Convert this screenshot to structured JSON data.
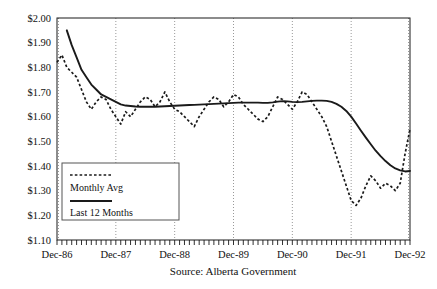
{
  "chart_data": {
    "type": "line",
    "title": "",
    "subtitle": "",
    "xlabel": "",
    "ylabel": "",
    "source": "Source: Alberta Government",
    "grid": true,
    "grid_style": "dotted-vertical-yearly",
    "legend_position": "inside-lower-left",
    "ylim": [
      1.1,
      2.0
    ],
    "ytick_labels": [
      "$2.00",
      "$1.90",
      "$1.80",
      "$1.70",
      "$1.60",
      "$1.50",
      "$1.40",
      "$1.30",
      "$1.20",
      "$1.10"
    ],
    "ytick_values": [
      2.0,
      1.9,
      1.8,
      1.7,
      1.6,
      1.5,
      1.4,
      1.3,
      1.2,
      1.1
    ],
    "xtick_labels": [
      "Dec-86",
      "Dec-87",
      "Dec-88",
      "Dec-89",
      "Dec-90",
      "Dec-91",
      "Dec-92"
    ],
    "xtick_values": [
      0,
      12,
      24,
      36,
      48,
      60,
      72
    ],
    "xlim": [
      0,
      72
    ],
    "x_minor_tick_interval_months": 1,
    "series": [
      {
        "name": "Monthly Avg",
        "style": "dotted",
        "color": "#1a1a1a",
        "values": [
          1.82,
          1.85,
          1.8,
          1.78,
          1.76,
          1.71,
          1.66,
          1.63,
          1.66,
          1.68,
          1.67,
          1.63,
          1.6,
          1.57,
          1.62,
          1.6,
          1.63,
          1.66,
          1.68,
          1.67,
          1.64,
          1.66,
          1.7,
          1.66,
          1.63,
          1.62,
          1.6,
          1.58,
          1.56,
          1.6,
          1.63,
          1.66,
          1.68,
          1.67,
          1.64,
          1.66,
          1.69,
          1.68,
          1.65,
          1.63,
          1.61,
          1.59,
          1.58,
          1.6,
          1.64,
          1.68,
          1.67,
          1.65,
          1.63,
          1.66,
          1.7,
          1.69,
          1.66,
          1.63,
          1.6,
          1.56,
          1.5,
          1.44,
          1.38,
          1.32,
          1.26,
          1.24,
          1.27,
          1.32,
          1.36,
          1.34,
          1.31,
          1.33,
          1.32,
          1.3,
          1.33,
          1.45,
          1.55
        ]
      },
      {
        "name": "Last 12 Months",
        "style": "solid",
        "color": "#1a1a1a",
        "values": [
          2.1,
          2.02,
          1.95,
          1.89,
          1.84,
          1.79,
          1.76,
          1.73,
          1.71,
          1.69,
          1.68,
          1.67,
          1.66,
          1.65,
          1.645,
          1.643,
          1.641,
          1.64,
          1.64,
          1.64,
          1.64,
          1.641,
          1.642,
          1.643,
          1.644,
          1.645,
          1.646,
          1.647,
          1.648,
          1.649,
          1.65,
          1.651,
          1.652,
          1.653,
          1.654,
          1.655,
          1.656,
          1.657,
          1.657,
          1.657,
          1.657,
          1.657,
          1.656,
          1.656,
          1.658,
          1.661,
          1.663,
          1.662,
          1.66,
          1.659,
          1.66,
          1.662,
          1.664,
          1.665,
          1.665,
          1.664,
          1.66,
          1.652,
          1.64,
          1.623,
          1.6,
          1.572,
          1.543,
          1.515,
          1.488,
          1.462,
          1.44,
          1.42,
          1.403,
          1.39,
          1.382,
          1.378,
          1.38
        ]
      }
    ]
  },
  "legend": {
    "entries": [
      {
        "label": "Monthly Avg",
        "style": "dotted"
      },
      {
        "label": "Last 12 Months",
        "style": "solid"
      }
    ]
  }
}
